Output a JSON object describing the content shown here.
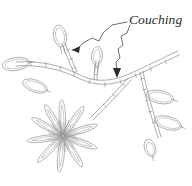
{
  "figure": {
    "title": "Couching",
    "kind": "embroidery-stitch-diagram",
    "background_color": "#ffffff",
    "line_color": "#8a8a8a",
    "label_color": "#2b2b2b",
    "width": 192,
    "height": 186
  },
  "annotation": {
    "label": "Couching",
    "label_x": 129,
    "label_y": 24,
    "leader_count": 2,
    "leaders": [
      {
        "name": "leader-to-bud-stem",
        "path": "M127,22 L112,25 L103,33 L99,41 L92,38 L83,43 L78,49 L72,50",
        "arrow_points": "72,50 80,46 79,53",
        "target": "upper-bud-stem"
      },
      {
        "name": "leader-to-main-stem",
        "path": "M130,25 L127,33 L121,36 L123,45 L118,49 L120,58 L116,62 L117,72",
        "arrow_points": "117,78 113,68 121,68",
        "target": "main-stem"
      }
    ]
  },
  "motif": {
    "stems": [
      {
        "name": "main-stem",
        "outer": "M16,62 C40,60 62,66 78,74 C94,82 108,82 124,76 C142,69 162,58 178,51",
        "inner": "M16,66 C40,64 62,70 78,78 C95,86 109,86 125,80 C143,73 163,62 179,55",
        "ticks": [
          "M31,61.3 L31,65.6",
          "M46,62.5 L45.6,66.9",
          "M61,65.6 L60,70.0",
          "M75,71.6 L73.6,75.9",
          "M90,79.0 L89,83.3",
          "M105,82.6 L105,86.9",
          "M120,79.6 L121,83.9",
          "M135,73.6 L136.4,77.6",
          "M150,66.9 L151.4,70.9",
          "M165,59.9 L166.4,63.9"
        ]
      },
      {
        "name": "upper-bud-stem",
        "outer": "M74,73 C70,64 66,54 62,44",
        "inner": "M77,72 C73,63 69,53 65,43",
        "ticks": [
          "M72.6,68.5 L75.8,67.3",
          "M69.4,59.5 L72.6,58.3",
          "M66.4,50.5 L69.6,49.3"
        ]
      },
      {
        "name": "second-bud-stem",
        "outer": "M94,80 C94,73 95,67 96,61",
        "inner": "M97,80 C97,73 98,67 99,61",
        "ticks": [
          "M94.3,74.5 L97.3,74.5",
          "M95.1,67.5 L98.1,67.5"
        ]
      },
      {
        "name": "right-branch",
        "outer": "M140,72 C142,84 146,98 150,112 C153,122 156,130 158,138",
        "inner": "M143,71 C145,83 149,97 153,111 C156,121 159,129 161,137",
        "ticks": [
          "M140.8,79 L143.8,78.4",
          "M142.6,90 L145.6,89.4",
          "M145.4,101 L148.4,100.4",
          "M148.6,112 L151.6,111.4",
          "M152,123 L155,122.4"
        ]
      },
      {
        "name": "flower-stem",
        "outer": "M128,78 C116,92 102,106 90,118",
        "inner": "M131,80 C119,94 105,108 93,120",
        "ticks": [
          "M122.6,84 L125.2,86",
          "M112.6,94 L115.2,96",
          "M102.6,104 L105.2,106"
        ]
      }
    ],
    "leaves": [
      {
        "name": "leaf-left-tip",
        "cx": 16,
        "cy": 64,
        "rx": 14,
        "ry": 6.5,
        "rot": -8
      },
      {
        "name": "leaf-left-lower",
        "cx": 35,
        "cy": 86,
        "rx": 13,
        "ry": 6,
        "rot": 20
      },
      {
        "name": "leaf-right-upper",
        "cx": 160,
        "cy": 97,
        "rx": 14,
        "ry": 6.5,
        "rot": 12
      },
      {
        "name": "leaf-right-lower",
        "cx": 168,
        "cy": 123,
        "rx": 14,
        "ry": 6.5,
        "rot": 16
      },
      {
        "name": "leaf-right-bottom",
        "cx": 150,
        "cy": 148,
        "rx": 9,
        "ry": 5.5,
        "rot": 72
      }
    ],
    "buds": [
      {
        "name": "bud-upper",
        "cx": 60,
        "cy": 36,
        "rx": 6.5,
        "ry": 11,
        "rot": -10
      },
      {
        "name": "bud-second",
        "cx": 97,
        "cy": 56,
        "rx": 5.5,
        "ry": 9.5,
        "rot": 4
      }
    ],
    "flower": {
      "name": "daisy-flower",
      "center_x": 63,
      "center_y": 136,
      "petal_count": 10,
      "petal_length": 34,
      "petal_width": 8,
      "petal_angles": [
        268,
        305,
        342,
        20,
        58,
        96,
        134,
        172,
        210,
        240
      ],
      "center_ray_count": 36
    }
  }
}
